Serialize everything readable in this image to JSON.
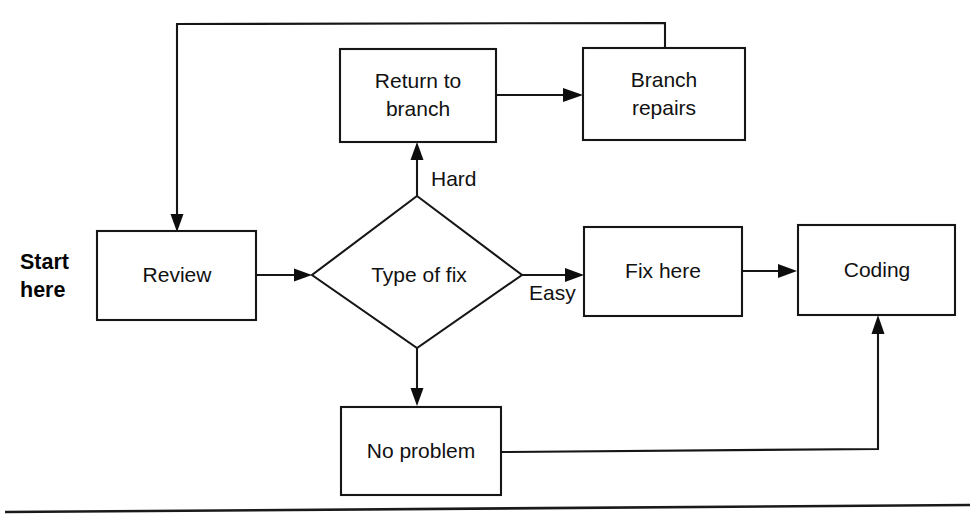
{
  "diagram": {
    "start_label": {
      "line1": "Start",
      "line2": "here"
    },
    "nodes": [
      {
        "id": "review",
        "label": "Review",
        "shape": "rectangle"
      },
      {
        "id": "type_of_fix",
        "label": "Type of fix",
        "shape": "diamond"
      },
      {
        "id": "return_to_branch",
        "label_line1": "Return to",
        "label_line2": "branch",
        "label": "Return to branch",
        "shape": "rectangle"
      },
      {
        "id": "branch_repairs",
        "label_line1": "Branch",
        "label_line2": "repairs",
        "label": "Branch repairs",
        "shape": "rectangle"
      },
      {
        "id": "fix_here",
        "label": "Fix here",
        "shape": "rectangle"
      },
      {
        "id": "coding",
        "label": "Coding",
        "shape": "rectangle"
      },
      {
        "id": "no_problem",
        "label": "No problem",
        "shape": "rectangle"
      }
    ],
    "edges": [
      {
        "id": "review_to_type",
        "from": "review",
        "to": "type_of_fix",
        "label": ""
      },
      {
        "id": "type_hard_to_return",
        "from": "type_of_fix",
        "to": "return_to_branch",
        "label": "Hard"
      },
      {
        "id": "type_easy_to_fix",
        "from": "type_of_fix",
        "to": "fix_here",
        "label": "Easy"
      },
      {
        "id": "type_to_no_problem",
        "from": "type_of_fix",
        "to": "no_problem",
        "label": ""
      },
      {
        "id": "return_to_repairs",
        "from": "return_to_branch",
        "to": "branch_repairs",
        "label": ""
      },
      {
        "id": "repairs_back_to_review",
        "from": "branch_repairs",
        "to": "review",
        "label": ""
      },
      {
        "id": "fix_to_coding",
        "from": "fix_here",
        "to": "coding",
        "label": ""
      },
      {
        "id": "no_problem_to_coding",
        "from": "no_problem",
        "to": "coding",
        "label": ""
      }
    ],
    "colors": {
      "stroke": "#161616",
      "fill": "#ffffff",
      "text": "#111111"
    }
  }
}
